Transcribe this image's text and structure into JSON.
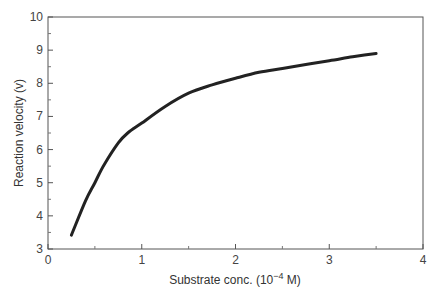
{
  "chart_data": {
    "type": "line",
    "title": "",
    "xlabel": "Substrate conc. (10⁻⁴ M)",
    "xlabel_base": "Substrate conc. (10",
    "xlabel_exp": "−4",
    "xlabel_tail": " M)",
    "ylabel": "Reaction velocity (v)",
    "xlim": [
      0,
      4
    ],
    "ylim": [
      3,
      10
    ],
    "xticks": [
      0,
      1,
      2,
      3,
      4
    ],
    "xminor": [
      0.5,
      1.5,
      2.5,
      3.5
    ],
    "yticks": [
      3,
      4,
      5,
      6,
      7,
      8,
      9,
      10
    ],
    "yminor": [
      3.5,
      4.5,
      5.5,
      6.5,
      7.5,
      8.5,
      9.5
    ],
    "grid": false,
    "legend": null,
    "line_color": "#222222",
    "series": [
      {
        "name": "Reaction velocity",
        "x": [
          0.25,
          0.4,
          0.5,
          0.6,
          0.75,
          0.85,
          1.0,
          1.25,
          1.5,
          1.75,
          2.0,
          2.25,
          2.5,
          2.75,
          3.0,
          3.25,
          3.5
        ],
        "y": [
          3.42,
          4.45,
          5.0,
          5.55,
          6.2,
          6.5,
          6.8,
          7.3,
          7.7,
          7.95,
          8.15,
          8.33,
          8.45,
          8.57,
          8.68,
          8.8,
          8.9
        ]
      }
    ]
  }
}
